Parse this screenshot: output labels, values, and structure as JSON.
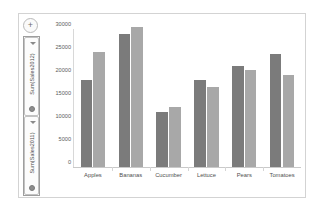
{
  "chart_data": {
    "type": "bar",
    "title": "",
    "xlabel": "",
    "ylabel": "",
    "categories": [
      "Apples",
      "Bananas",
      "Cucumber",
      "Lettuce",
      "Pears",
      "Tomatoes"
    ],
    "series": [
      {
        "name": "Sum(Sales2011)",
        "color": "#7b7b7b",
        "values": [
          19000,
          29000,
          12000,
          19000,
          22000,
          24500
        ]
      },
      {
        "name": "Sum(Sales2012)",
        "color": "#a8a8a8",
        "values": [
          25000,
          30500,
          13000,
          17500,
          21000,
          20000
        ]
      }
    ],
    "ylim": [
      0,
      30000
    ],
    "yticks": [
      30000,
      25000,
      20000,
      15000,
      10000,
      5000,
      0
    ],
    "ytick_labels": [
      "30000",
      "25000",
      "20000",
      "15000",
      "10000",
      "5000",
      "0"
    ],
    "grid": false,
    "legend_position": "left-vertical"
  },
  "legend_control": {
    "add_button_label": "+",
    "items": [
      {
        "label": "Sum(Sales2012)",
        "marker": "bullet-dot",
        "caret": "chevron-down-icon"
      },
      {
        "label": "Sum(Sales2011)",
        "marker": "bullet-dot",
        "caret": "chevron-down-icon"
      }
    ]
  }
}
